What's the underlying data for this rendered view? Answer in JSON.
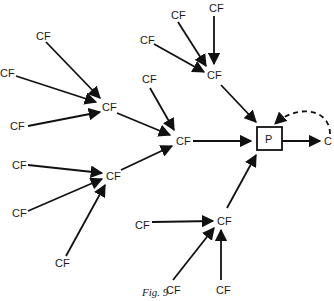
{
  "figure": {
    "caption": "Fig. 9",
    "central_node": "P",
    "output_node": "C",
    "node_label": "CF"
  },
  "nodes": [
    {
      "id": "a1",
      "label": "CF",
      "x": 42,
      "y": 36
    },
    {
      "id": "a2",
      "label": "CF",
      "x": 4,
      "y": 74
    },
    {
      "id": "a3",
      "label": "CF",
      "x": 17,
      "y": 129
    },
    {
      "id": "h1",
      "label": "CF",
      "x": 108,
      "y": 109
    },
    {
      "id": "b1",
      "label": "CF",
      "x": 148,
      "y": 42
    },
    {
      "id": "b2",
      "label": "CF",
      "x": 148,
      "y": 81
    },
    {
      "id": "t1",
      "label": "CF",
      "x": 146,
      "y": 12
    },
    {
      "id": "t2",
      "label": "CF",
      "x": 216,
      "y": 9
    },
    {
      "id": "t3",
      "label": "CF",
      "x": 212,
      "y": 76
    },
    {
      "id": "m",
      "label": "CF",
      "x": 182,
      "y": 139
    },
    {
      "id": "c1",
      "label": "CF",
      "x": 17,
      "y": 166
    },
    {
      "id": "c2",
      "label": "CF",
      "x": 17,
      "y": 214
    },
    {
      "id": "c3",
      "label": "CF",
      "x": 59,
      "y": 265
    },
    {
      "id": "h2",
      "label": "CF",
      "x": 110,
      "y": 176
    },
    {
      "id": "d1",
      "label": "CF",
      "x": 140,
      "y": 226
    },
    {
      "id": "d2",
      "label": "CF",
      "x": 174,
      "y": 290
    },
    {
      "id": "d3",
      "label": "CF",
      "x": 220,
      "y": 290
    },
    {
      "id": "h3",
      "label": "CF",
      "x": 224,
      "y": 222
    }
  ]
}
